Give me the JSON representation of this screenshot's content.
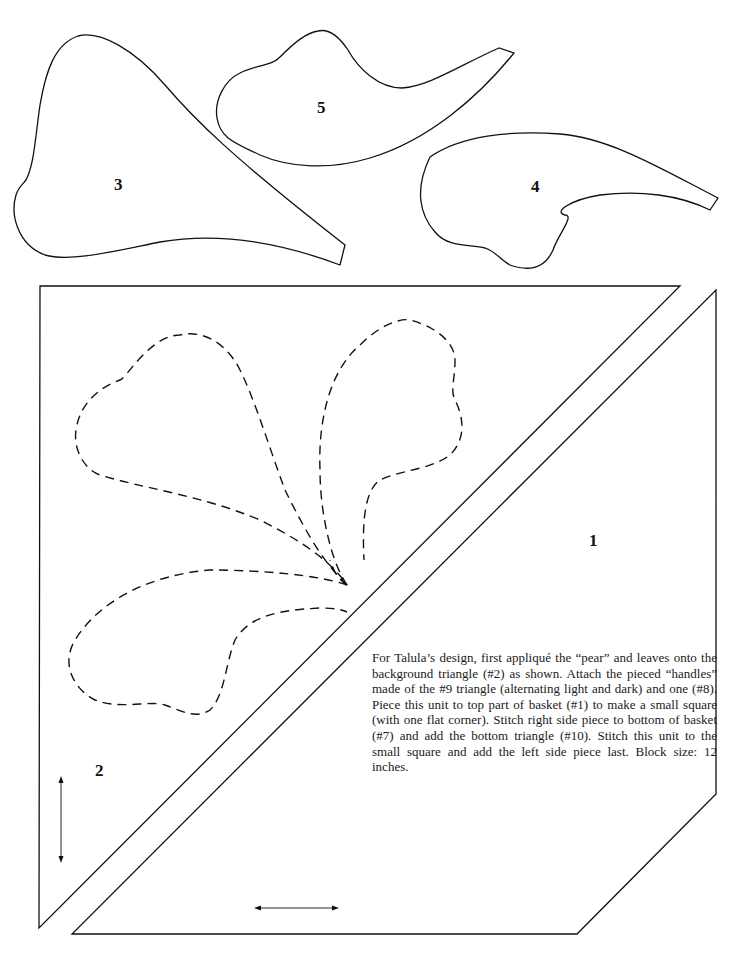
{
  "pattern": {
    "pieces": [
      {
        "id": "piece-1",
        "label": "1",
        "description": "top part of basket"
      },
      {
        "id": "piece-2",
        "label": "2",
        "description": "background triangle"
      },
      {
        "id": "piece-3",
        "label": "3",
        "description": "pear"
      },
      {
        "id": "piece-4",
        "label": "4",
        "description": "leaf"
      },
      {
        "id": "piece-5",
        "label": "5",
        "description": "leaf"
      }
    ],
    "instructions": "For Talula’s design, first appliqué the “pear” and leaves onto the background triangle (#2) as shown. Attach the pieced “handles” made of the #9 triangle (alternating light and dark) and one (#8). Piece this unit to top part of basket (#1) to make a small square (with one flat corner). Stitch right side piece to bottom of basket (#7) and add the bottom triangle (#10). Stitch this unit to the small square and add the left side piece last. Block size: 12 inches.",
    "grainlines": [
      {
        "id": "grain-vertical",
        "orientation": "vertical"
      },
      {
        "id": "grain-horizontal",
        "orientation": "horizontal"
      }
    ],
    "colors": {
      "line": "#111111",
      "background": "#ffffff"
    }
  }
}
